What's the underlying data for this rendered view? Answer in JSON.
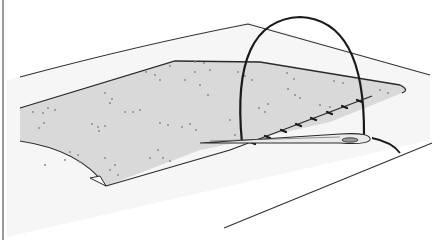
{
  "diagram": {
    "colors": {
      "background": "#ffffff",
      "board": "#f6f6f6",
      "fabric": "#d9d9d9",
      "dots": "#8a8a8a",
      "outline": "#2a2a2a",
      "thread": "#1a1a1a",
      "needle": "#e8e8e8"
    },
    "elements": [
      "work-surface",
      "fabric-piece",
      "fabric-dots",
      "thread-loop",
      "stitches",
      "needle",
      "folded-corner"
    ]
  }
}
